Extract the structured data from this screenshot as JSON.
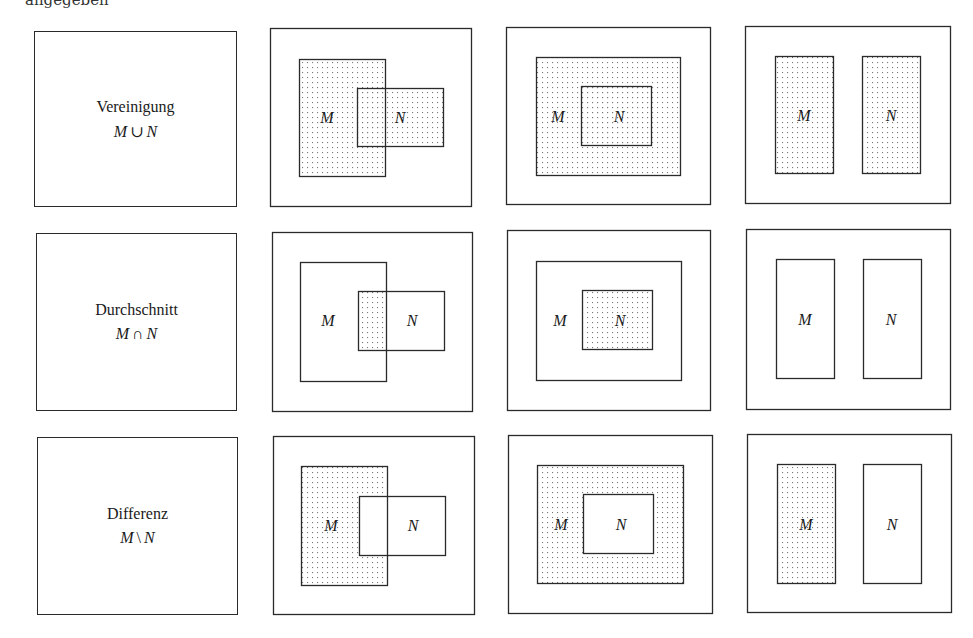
{
  "top_text": "angegeben",
  "dot_color": "#777777",
  "line_color": "#2a2a2a",
  "operations": [
    {
      "name": "Vereinigung",
      "formula_left": "M",
      "formula_symbol": "∪",
      "formula_right": "N",
      "label_box": {
        "x": 34,
        "y": 31,
        "w": 203,
        "h": 176
      }
    },
    {
      "name": "Durchschnitt",
      "formula_left": "M",
      "formula_symbol": "∩",
      "formula_right": "N",
      "label_box": {
        "x": 36,
        "y": 233,
        "w": 201,
        "h": 178
      }
    },
    {
      "name": "Differenz",
      "formula_left": "M",
      "formula_symbol": "\\",
      "formula_right": "N",
      "label_box": {
        "x": 37,
        "y": 437,
        "w": 201,
        "h": 178
      }
    }
  ],
  "set_labels": {
    "m": "M",
    "n": "N"
  },
  "diagrams": [
    {
      "row": 0,
      "case": "overlap",
      "shading": "union",
      "outer": [
        270,
        28,
        201,
        178
      ],
      "M": [
        299,
        59,
        86,
        117
      ],
      "N": [
        357,
        88,
        86,
        58
      ],
      "m_label": [
        327,
        123
      ],
      "n_label": [
        400,
        123
      ]
    },
    {
      "row": 0,
      "case": "subset",
      "shading": "union",
      "outer": [
        506,
        27,
        204,
        177
      ],
      "M": [
        536,
        57,
        144,
        118
      ],
      "N": [
        581,
        86,
        70,
        59
      ],
      "m_label": [
        558,
        122
      ],
      "n_label": [
        619,
        122
      ]
    },
    {
      "row": 0,
      "case": "disjoint",
      "shading": "union",
      "outer": [
        745,
        26,
        205,
        177
      ],
      "M": [
        775,
        56,
        58,
        117
      ],
      "N": [
        862,
        56,
        58,
        117
      ],
      "m_label": [
        804,
        121
      ],
      "n_label": [
        891,
        121
      ]
    },
    {
      "row": 1,
      "case": "overlap",
      "shading": "intersection",
      "outer": [
        272,
        232,
        200,
        179
      ],
      "M": [
        300,
        262,
        86,
        119
      ],
      "N": [
        358,
        291,
        86,
        59
      ],
      "m_label": [
        328,
        326
      ],
      "n_label": [
        412,
        326
      ]
    },
    {
      "row": 1,
      "case": "subset",
      "shading": "intersection",
      "outer": [
        507,
        230,
        203,
        180
      ],
      "M": [
        536,
        261,
        145,
        119
      ],
      "N": [
        582,
        290,
        70,
        59
      ],
      "m_label": [
        560,
        326
      ],
      "n_label": [
        620,
        326
      ]
    },
    {
      "row": 1,
      "case": "disjoint",
      "shading": "intersection",
      "outer": [
        746,
        229,
        204,
        180
      ],
      "M": [
        776,
        259,
        58,
        119
      ],
      "N": [
        863,
        259,
        58,
        119
      ],
      "m_label": [
        805,
        325
      ],
      "n_label": [
        891,
        325
      ]
    },
    {
      "row": 2,
      "case": "overlap",
      "shading": "difference",
      "outer": [
        273,
        436,
        201,
        178
      ],
      "M": [
        301,
        466,
        86,
        119
      ],
      "N": [
        359,
        496,
        86,
        59
      ],
      "m_label": [
        331,
        531
      ],
      "n_label": [
        413,
        531
      ]
    },
    {
      "row": 2,
      "case": "subset",
      "shading": "difference",
      "outer": [
        508,
        435,
        204,
        178
      ],
      "M": [
        537,
        465,
        146,
        118
      ],
      "N": [
        583,
        494,
        70,
        59
      ],
      "m_label": [
        561,
        530
      ],
      "n_label": [
        621,
        530
      ]
    },
    {
      "row": 2,
      "case": "disjoint",
      "shading": "difference",
      "outer": [
        747,
        434,
        204,
        178
      ],
      "M": [
        777,
        464,
        58,
        119
      ],
      "N": [
        863,
        464,
        58,
        119
      ],
      "m_label": [
        806,
        530
      ],
      "n_label": [
        892,
        530
      ]
    }
  ]
}
